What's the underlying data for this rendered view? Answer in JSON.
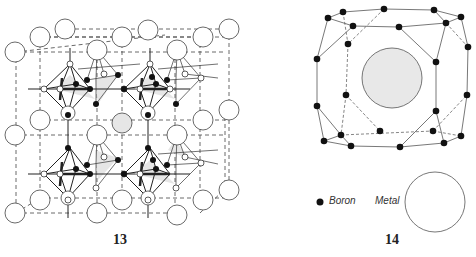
{
  "figures": [
    {
      "id": "13",
      "label": "13",
      "description": "Cubic lattice of large metal atoms with B6 octahedra linked by boron atoms (CaB6-type framework)"
    },
    {
      "id": "14",
      "label": "14",
      "description": "Truncated-octahedron boron cage (B24) enclosing a central metal atom"
    }
  ],
  "legend": {
    "boron_label": "Boron",
    "metal_label": "Metal"
  },
  "colors": {
    "line": "#333333",
    "metal_fill": "#ffffff",
    "shaded_fill": "#e6e6e6",
    "boron_fill": "#111111"
  }
}
